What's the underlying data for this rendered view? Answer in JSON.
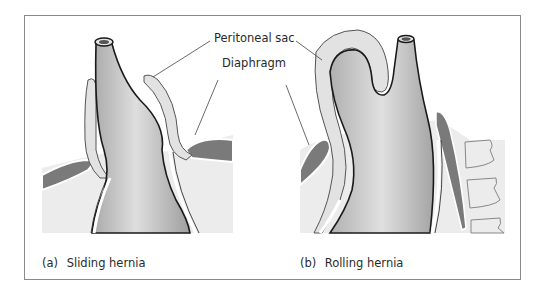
{
  "figure": {
    "labels": {
      "peritoneal_sac": "Peritoneal sac",
      "diaphragm": "Diaphragm"
    },
    "panels": [
      {
        "tag": "(a)",
        "title": "Sliding hernia"
      },
      {
        "tag": "(b)",
        "title": "Rolling hernia"
      }
    ],
    "colors": {
      "frame_border": "#8a8a8a",
      "background_tissue": "#ececec",
      "peritoneal_sac": "#e2e2e2",
      "stomach_light": "#dcdcdc",
      "stomach_dark": "#a8a8a8",
      "diaphragm": "#7a7a7a",
      "outline": "#1a1a1a"
    }
  }
}
